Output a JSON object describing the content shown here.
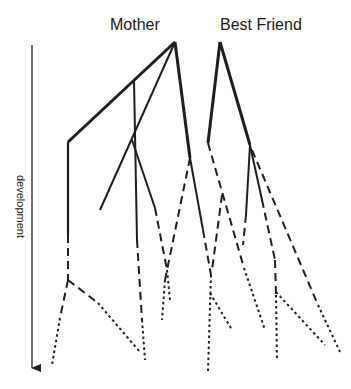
{
  "diagram": {
    "labels": {
      "mother": "Mother",
      "best_friend": "Best Friend",
      "axis": "development"
    },
    "colors": {
      "line": "#1e1e1e",
      "background": "#ffffff"
    },
    "legend_of_line_styles": [
      "solid",
      "dashed",
      "dotted"
    ],
    "trees": [
      {
        "name": "Mother",
        "apex": [
          175,
          42
        ],
        "branches": [
          {
            "style": "solid-thick",
            "points": [
              [
                175,
                42
              ],
              [
                68,
                142
              ]
            ]
          },
          {
            "style": "solid",
            "points": [
              [
                68,
                142
              ],
              [
                68,
                235
              ]
            ]
          },
          {
            "style": "dashed",
            "points": [
              [
                68,
                235
              ],
              [
                68,
                280
              ]
            ]
          },
          {
            "style": "dashed",
            "points": [
              [
                68,
                280
              ],
              [
                60,
                320
              ]
            ]
          },
          {
            "style": "dotted",
            "points": [
              [
                60,
                320
              ],
              [
                52,
                365
              ]
            ]
          },
          {
            "style": "dashed",
            "points": [
              [
                68,
                280
              ],
              [
                98,
                303
              ]
            ]
          },
          {
            "style": "dotted",
            "points": [
              [
                98,
                303
              ],
              [
                140,
                352
              ]
            ]
          },
          {
            "style": "solid",
            "points": [
              [
                134,
                80
              ],
              [
                137,
                240
              ]
            ]
          },
          {
            "style": "dashed",
            "points": [
              [
                137,
                240
              ],
              [
                142,
                320
              ]
            ]
          },
          {
            "style": "dotted",
            "points": [
              [
                142,
                320
              ],
              [
                145,
                360
              ]
            ]
          },
          {
            "style": "solid",
            "points": [
              [
                175,
                42
              ],
              [
                100,
                210
              ]
            ]
          },
          {
            "style": "solid",
            "points": [
              [
                132,
                140
              ],
              [
                155,
                208
              ]
            ]
          },
          {
            "style": "dashed",
            "points": [
              [
                155,
                208
              ],
              [
                167,
                270
              ]
            ]
          },
          {
            "style": "dotted",
            "points": [
              [
                167,
                270
              ],
              [
                170,
                300
              ]
            ]
          },
          {
            "style": "solid-thick",
            "points": [
              [
                175,
                42
              ],
              [
                190,
                158
              ]
            ]
          },
          {
            "style": "dashed",
            "points": [
              [
                190,
                158
              ],
              [
                165,
                280
              ]
            ]
          },
          {
            "style": "dotted",
            "points": [
              [
                165,
                280
              ],
              [
                162,
                320
              ]
            ]
          },
          {
            "style": "solid",
            "points": [
              [
                190,
                158
              ],
              [
                203,
                230
              ]
            ]
          },
          {
            "style": "dashed",
            "points": [
              [
                203,
                230
              ],
              [
                211,
                275
              ]
            ]
          },
          {
            "style": "dotted",
            "points": [
              [
                211,
                275
              ],
              [
                208,
                372
              ]
            ]
          },
          {
            "style": "dotted",
            "points": [
              [
                211,
                295
              ],
              [
                232,
                330
              ]
            ]
          }
        ]
      },
      {
        "name": "Best Friend",
        "apex": [
          220,
          42
        ],
        "branches": [
          {
            "style": "solid-thick",
            "points": [
              [
                220,
                42
              ],
              [
                208,
                143
              ]
            ]
          },
          {
            "style": "dashed",
            "points": [
              [
                208,
                143
              ],
              [
                244,
                270
              ]
            ]
          },
          {
            "style": "dotted",
            "points": [
              [
                244,
                270
              ],
              [
                265,
                330
              ]
            ]
          },
          {
            "style": "dashed",
            "points": [
              [
                222,
                195
              ],
              [
                212,
                270
              ]
            ]
          },
          {
            "style": "solid-thick",
            "points": [
              [
                220,
                42
              ],
              [
                250,
                145
              ]
            ]
          },
          {
            "style": "solid",
            "points": [
              [
                250,
                145
              ],
              [
                245,
                215
              ]
            ]
          },
          {
            "style": "dashed",
            "points": [
              [
                245,
                215
              ],
              [
                243,
                245
              ]
            ]
          },
          {
            "style": "solid",
            "points": [
              [
                250,
                145
              ],
              [
                262,
                200
              ]
            ]
          },
          {
            "style": "dashed",
            "points": [
              [
                262,
                200
              ],
              [
                275,
                260
              ]
            ]
          },
          {
            "style": "dashed",
            "points": [
              [
                275,
                260
              ],
              [
                276,
                295
              ]
            ]
          },
          {
            "style": "dotted",
            "points": [
              [
                276,
                295
              ],
              [
                277,
                360
              ]
            ]
          },
          {
            "style": "dotted",
            "points": [
              [
                276,
                292
              ],
              [
                325,
                345
              ]
            ]
          },
          {
            "style": "dashed",
            "points": [
              [
                252,
                150
              ],
              [
                318,
                305
              ]
            ]
          },
          {
            "style": "dotted",
            "points": [
              [
                318,
                305
              ],
              [
                340,
                352
              ]
            ]
          }
        ]
      }
    ],
    "axis": {
      "start": [
        32,
        45
      ],
      "end": [
        32,
        375
      ],
      "label_position": [
        20,
        215
      ]
    }
  }
}
